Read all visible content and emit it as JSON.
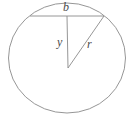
{
  "figure": {
    "background_color": "#ffffff",
    "stroke_color": "#8a8a8a",
    "label_color": "#4a4a4a",
    "width": 132,
    "height": 123
  },
  "labels": {
    "chord": "b",
    "apothem": "y",
    "radius": "r"
  },
  "geometry": {
    "circle": {
      "center_x": 67,
      "center_y": 58,
      "radius_x": 58.5,
      "radius_y": 55
    },
    "chord": {
      "x1": 30,
      "y1": 16,
      "x2": 104,
      "y2": 16
    },
    "apothem_segment": {
      "x1": 67,
      "y1": 16,
      "x2": 68,
      "y2": 68
    },
    "radius_segment": {
      "x1": 68,
      "y1": 68,
      "x2": 104,
      "y2": 16
    }
  }
}
